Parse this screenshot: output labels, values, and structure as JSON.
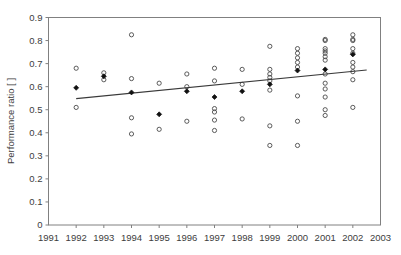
{
  "chart_data": {
    "type": "scatter",
    "title": "",
    "subtitle": "",
    "xlabel": "",
    "ylabel": "Performance ratio [ ]",
    "xlim": [
      1991,
      2003
    ],
    "ylim": [
      0,
      0.9
    ],
    "grid": false,
    "legend": "none",
    "x_ticks": [
      "1991",
      "1992",
      "1993",
      "1994",
      "1995",
      "1996",
      "1997",
      "1998",
      "1999",
      "2000",
      "2001",
      "2002",
      "2003"
    ],
    "x_tick_values": [
      1991,
      1992,
      1993,
      1994,
      1995,
      1996,
      1997,
      1998,
      1999,
      2000,
      2001,
      2002,
      2003
    ],
    "y_ticks": [
      "0",
      "0.1",
      "0.2",
      "0.3",
      "0.4",
      "0.5",
      "0.6",
      "0.7",
      "0.8",
      "0.9"
    ],
    "y_tick_values": [
      0,
      0.1,
      0.2,
      0.3,
      0.4,
      0.5,
      0.6,
      0.7,
      0.8,
      0.9
    ],
    "marker_styles": {
      "individual": "open-circle",
      "annual_mean": "filled-diamond"
    },
    "series": [
      {
        "name": "Individual plant performance ratio",
        "marker": "open-circle",
        "points": [
          {
            "x": 1992,
            "y": 0.68
          },
          {
            "x": 1992,
            "y": 0.51
          },
          {
            "x": 1993,
            "y": 0.66
          },
          {
            "x": 1993,
            "y": 0.63
          },
          {
            "x": 1994,
            "y": 0.825
          },
          {
            "x": 1994,
            "y": 0.635
          },
          {
            "x": 1994,
            "y": 0.465
          },
          {
            "x": 1994,
            "y": 0.395
          },
          {
            "x": 1995,
            "y": 0.615
          },
          {
            "x": 1995,
            "y": 0.415
          },
          {
            "x": 1996,
            "y": 0.655
          },
          {
            "x": 1996,
            "y": 0.6
          },
          {
            "x": 1996,
            "y": 0.45
          },
          {
            "x": 1997,
            "y": 0.68
          },
          {
            "x": 1997,
            "y": 0.625
          },
          {
            "x": 1997,
            "y": 0.505
          },
          {
            "x": 1997,
            "y": 0.49
          },
          {
            "x": 1997,
            "y": 0.455
          },
          {
            "x": 1997,
            "y": 0.41
          },
          {
            "x": 1998,
            "y": 0.675
          },
          {
            "x": 1998,
            "y": 0.61
          },
          {
            "x": 1998,
            "y": 0.46
          },
          {
            "x": 1999,
            "y": 0.775
          },
          {
            "x": 1999,
            "y": 0.675
          },
          {
            "x": 1999,
            "y": 0.655
          },
          {
            "x": 1999,
            "y": 0.64
          },
          {
            "x": 1999,
            "y": 0.625
          },
          {
            "x": 1999,
            "y": 0.585
          },
          {
            "x": 1999,
            "y": 0.43
          },
          {
            "x": 1999,
            "y": 0.345
          },
          {
            "x": 2000,
            "y": 0.765
          },
          {
            "x": 2000,
            "y": 0.745
          },
          {
            "x": 2000,
            "y": 0.725
          },
          {
            "x": 2000,
            "y": 0.705
          },
          {
            "x": 2000,
            "y": 0.685
          },
          {
            "x": 2000,
            "y": 0.56
          },
          {
            "x": 2000,
            "y": 0.45
          },
          {
            "x": 2000,
            "y": 0.345
          },
          {
            "x": 2001,
            "y": 0.805
          },
          {
            "x": 2001,
            "y": 0.8
          },
          {
            "x": 2001,
            "y": 0.765
          },
          {
            "x": 2001,
            "y": 0.755
          },
          {
            "x": 2001,
            "y": 0.745
          },
          {
            "x": 2001,
            "y": 0.73
          },
          {
            "x": 2001,
            "y": 0.715
          },
          {
            "x": 2001,
            "y": 0.655
          },
          {
            "x": 2001,
            "y": 0.615
          },
          {
            "x": 2001,
            "y": 0.59
          },
          {
            "x": 2001,
            "y": 0.555
          },
          {
            "x": 2001,
            "y": 0.5
          },
          {
            "x": 2001,
            "y": 0.475
          },
          {
            "x": 2002,
            "y": 0.825
          },
          {
            "x": 2002,
            "y": 0.805
          },
          {
            "x": 2002,
            "y": 0.8
          },
          {
            "x": 2002,
            "y": 0.765
          },
          {
            "x": 2002,
            "y": 0.745
          },
          {
            "x": 2002,
            "y": 0.705
          },
          {
            "x": 2002,
            "y": 0.685
          },
          {
            "x": 2002,
            "y": 0.665
          },
          {
            "x": 2002,
            "y": 0.63
          },
          {
            "x": 2002,
            "y": 0.51
          }
        ]
      },
      {
        "name": "Annual mean performance ratio",
        "marker": "filled-diamond",
        "points": [
          {
            "x": 1992,
            "y": 0.595
          },
          {
            "x": 1993,
            "y": 0.645
          },
          {
            "x": 1994,
            "y": 0.575
          },
          {
            "x": 1995,
            "y": 0.48
          },
          {
            "x": 1996,
            "y": 0.58
          },
          {
            "x": 1997,
            "y": 0.555
          },
          {
            "x": 1998,
            "y": 0.58
          },
          {
            "x": 1999,
            "y": 0.61
          },
          {
            "x": 2000,
            "y": 0.67
          },
          {
            "x": 2001,
            "y": 0.675
          },
          {
            "x": 2002,
            "y": 0.74
          }
        ]
      }
    ],
    "trendline": {
      "name": "Linear trend",
      "x_start": 1992.0,
      "y_start": 0.548,
      "x_end": 2002.5,
      "y_end": 0.672
    }
  }
}
